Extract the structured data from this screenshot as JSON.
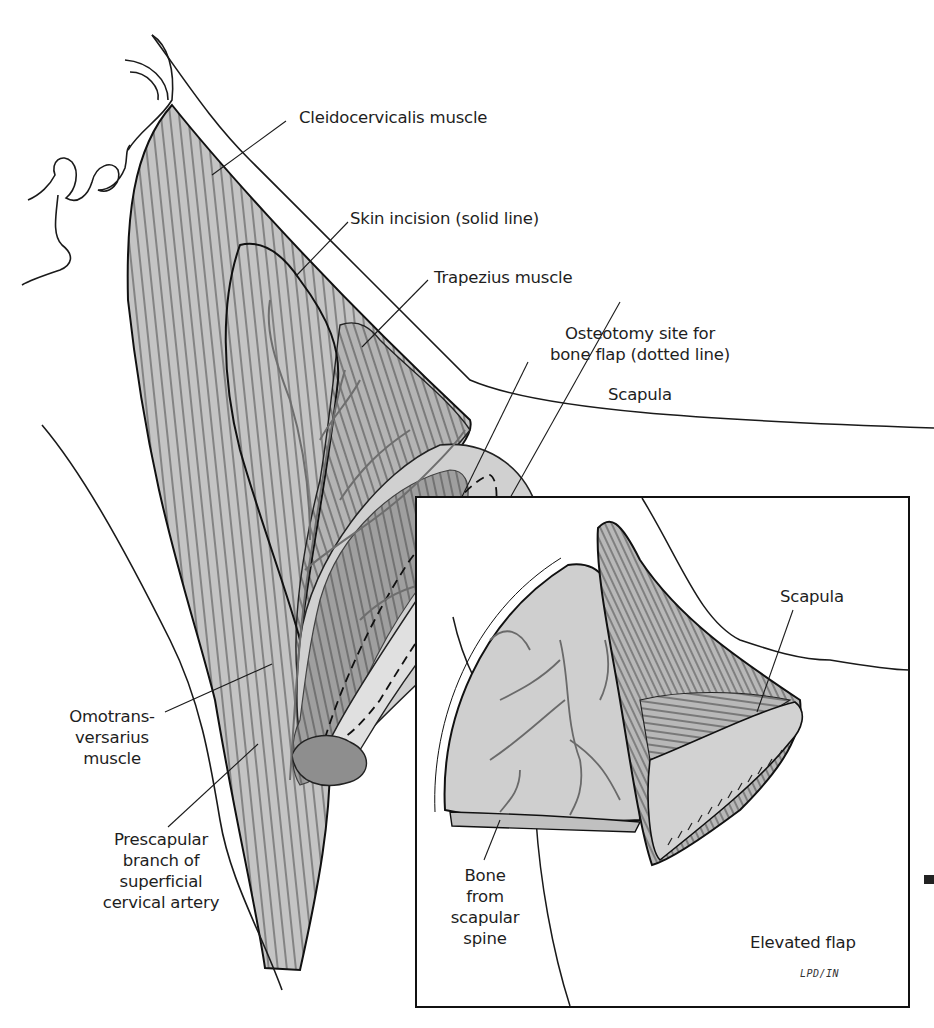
{
  "figure": {
    "colors": {
      "line": "#1a1a1a",
      "muscle_fill": "#c4c4c4",
      "muscle_dark_fill": "#9a9a9a",
      "bone_fill": "#d2d2d2",
      "vessel": "#6e6e6e",
      "background": "#ffffff"
    }
  },
  "main_view": {
    "labels": {
      "cleidocervicalis": "Cleidocervicalis muscle",
      "skin_incision": "Skin incision (solid line)",
      "trapezius": "Trapezius muscle",
      "osteotomy_line1": "Osteotomy site for",
      "osteotomy_line2": "bone flap (dotted line)",
      "scapula": "Scapula",
      "omotrans_line1": "Omotrans-",
      "omotrans_line2": "versarius",
      "omotrans_line3": "muscle",
      "prescap_line1": "Prescapular",
      "prescap_line2": "branch of",
      "prescap_line3": "superficial",
      "prescap_line4": "cervical artery"
    }
  },
  "inset": {
    "labels": {
      "scapula": "Scapula",
      "bone_line1": "Bone",
      "bone_line2": "from",
      "bone_line3": "scapular",
      "bone_line4": "spine",
      "elevated_flap": "Elevated flap",
      "signature": "LPD/IN"
    }
  }
}
